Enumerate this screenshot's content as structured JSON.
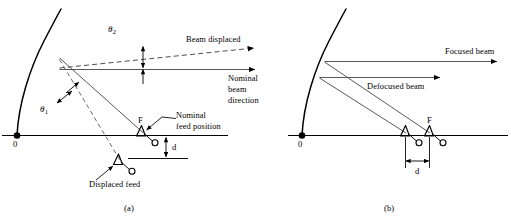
{
  "figure": {
    "stroke_color": "#000000",
    "ray_color": "#3a3a3a"
  },
  "panel_a": {
    "caption": "(a)",
    "vertex_label": "0",
    "focus_label": "F",
    "theta_scan": "θ",
    "theta_scan_sub": "1",
    "theta_beam": "θ",
    "theta_beam_sub": "2",
    "beam_displaced": "Beam displaced",
    "nominal_beam_direction": [
      "Nominal",
      "beam",
      "direction"
    ],
    "nominal_feed_position": [
      "Nominal",
      "feed position"
    ],
    "displaced_feed": "Displaced feed",
    "offset_dim": "d"
  },
  "panel_b": {
    "caption": "(b)",
    "vertex_label": "0",
    "focus_label": "F",
    "focused_beam": "Focused beam",
    "defocused_beam": "Defocused beam",
    "offset_dim": "d"
  }
}
